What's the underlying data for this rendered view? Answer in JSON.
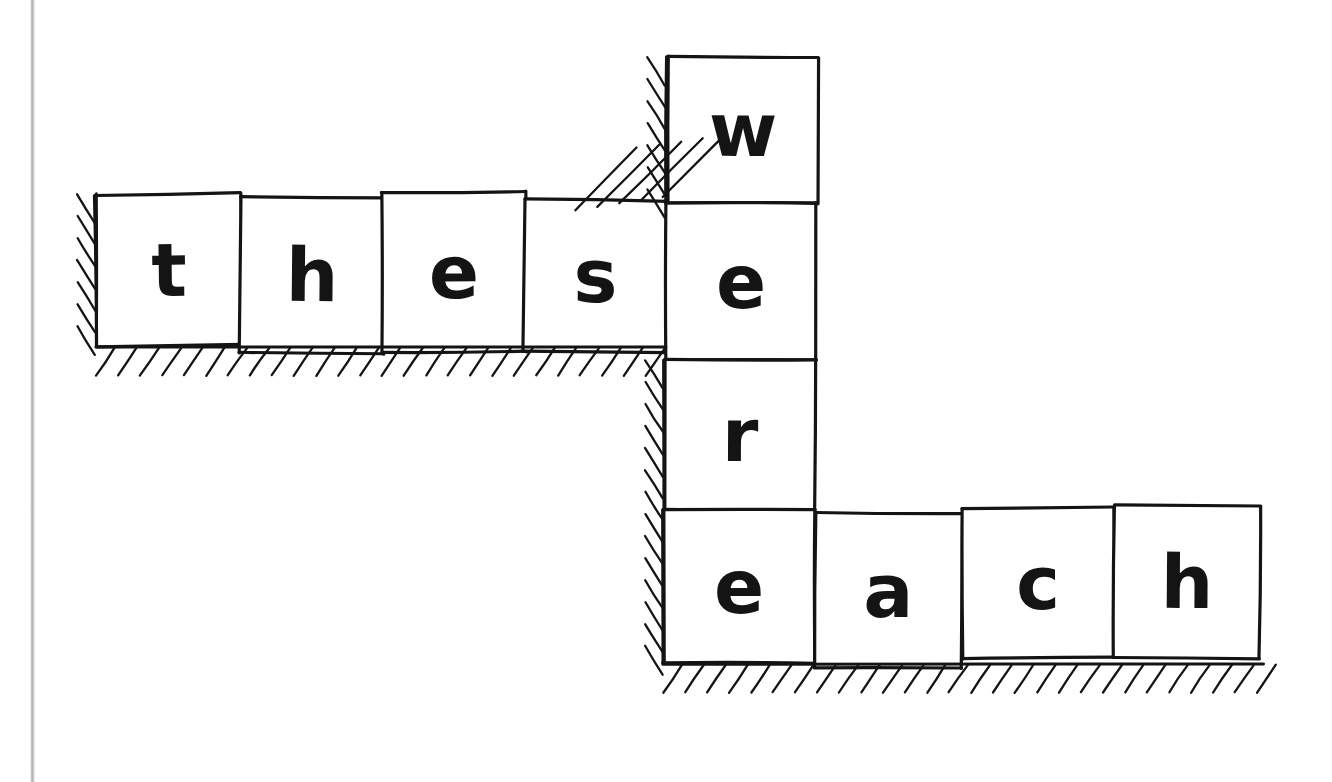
{
  "figure": {
    "kind": "hand-drawn-diagram",
    "background_color": "#ffffff",
    "ink_color": "#141414",
    "page_edge_color": "#bcbcbc"
  },
  "words": {
    "horizontal_top": "these",
    "vertical": "were",
    "horizontal_bottom": "each"
  },
  "tiles": [
    {
      "letter": "t",
      "group": "these",
      "x": 96,
      "y": 194,
      "w": 146,
      "h": 152,
      "rot": -0.8,
      "fs": 74
    },
    {
      "letter": "h",
      "group": "these",
      "x": 240,
      "y": 197,
      "w": 144,
      "h": 156,
      "rot": 0.5,
      "fs": 74
    },
    {
      "letter": "e",
      "group": "these",
      "x": 382,
      "y": 192,
      "w": 144,
      "h": 160,
      "rot": -0.4,
      "fs": 74
    },
    {
      "letter": "s",
      "group": "these",
      "x": 524,
      "y": 200,
      "w": 143,
      "h": 152,
      "rot": 0.6,
      "fs": 74
    },
    {
      "letter": "w",
      "group": "were",
      "x": 668,
      "y": 57,
      "w": 150,
      "h": 146,
      "rot": 0.3,
      "fs": 74
    },
    {
      "letter": "e",
      "group": "were",
      "x": 666,
      "y": 203,
      "w": 150,
      "h": 157,
      "rot": 0.0,
      "fs": 74
    },
    {
      "letter": "r",
      "group": "were",
      "x": 665,
      "y": 360,
      "w": 150,
      "h": 150,
      "rot": 0.2,
      "fs": 74
    },
    {
      "letter": "e",
      "group": "each",
      "x": 663,
      "y": 510,
      "w": 152,
      "h": 153,
      "rot": 0.0,
      "fs": 74
    },
    {
      "letter": "a",
      "group": "each",
      "x": 815,
      "y": 513,
      "w": 147,
      "h": 155,
      "rot": 0.4,
      "fs": 74
    },
    {
      "letter": "c",
      "group": "each",
      "x": 962,
      "y": 508,
      "w": 152,
      "h": 150,
      "rot": -0.3,
      "fs": 74
    },
    {
      "letter": "h",
      "group": "each",
      "x": 1114,
      "y": 506,
      "w": 146,
      "h": 152,
      "rot": 0.4,
      "fs": 74
    }
  ],
  "supports": [
    {
      "name": "left-wall-hatch",
      "orientation": "vertical",
      "x": 96,
      "y": 194,
      "length": 152
    },
    {
      "name": "top-row-ground-hatch",
      "orientation": "horizontal",
      "x": 96,
      "y": 347,
      "length": 570
    },
    {
      "name": "upper-wall-hatch",
      "orientation": "vertical",
      "x": 666,
      "y": 57,
      "length": 146
    },
    {
      "name": "corner-diagonal-hatch",
      "orientation": "corner",
      "x": 575,
      "y": 118,
      "length": 92
    },
    {
      "name": "lower-wall-hatch",
      "orientation": "vertical",
      "x": 664,
      "y": 360,
      "length": 303
    },
    {
      "name": "bottom-row-ground-hatch",
      "orientation": "horizontal",
      "x": 663,
      "y": 664,
      "length": 600
    }
  ]
}
